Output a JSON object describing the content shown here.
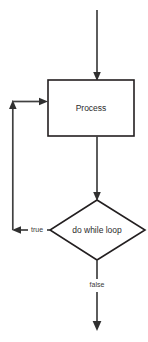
{
  "diagram": {
    "type": "flowchart",
    "background_color": "#ffffff",
    "stroke_color": "#231f20",
    "connector_color": "#404040",
    "text_color": "#2b2b2b",
    "nodes": [
      {
        "id": "process",
        "shape": "rectangle",
        "label": "Process",
        "center_x": 91,
        "center_y": 108,
        "width": 86,
        "height": 56
      },
      {
        "id": "decision",
        "shape": "diamond",
        "label": "do while loop",
        "center_x": 97,
        "center_y": 230,
        "width": 95,
        "height": 60
      }
    ],
    "edges": [
      {
        "id": "entry",
        "from": "start",
        "to": "process",
        "label": "",
        "arrow": true
      },
      {
        "id": "process-to-decision",
        "from": "process",
        "to": "decision",
        "label": "",
        "arrow": true
      },
      {
        "id": "decision-true-loop",
        "from": "decision",
        "to": "process",
        "label": "true",
        "arrow": true
      },
      {
        "id": "decision-false-exit",
        "from": "decision",
        "to": "end",
        "label": "false",
        "arrow": true
      }
    ],
    "labels": {
      "process": "Process",
      "decision": "do while loop",
      "true_branch": "true",
      "false_branch": "false"
    }
  }
}
